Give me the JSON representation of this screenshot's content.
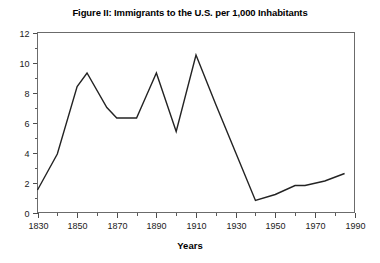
{
  "chart_data": {
    "type": "line",
    "title": "Figure II: Immigrants to the U.S. per 1,000 Inhabitants",
    "xlabel": "Years",
    "ylabel": "",
    "xlim": [
      1830,
      1990
    ],
    "ylim": [
      0,
      12
    ],
    "grid": false,
    "legend": "none",
    "x_major_ticks": [
      1830,
      1850,
      1870,
      1890,
      1910,
      1930,
      1950,
      1970,
      1990
    ],
    "x_minor_ticks": [
      1840,
      1860,
      1880,
      1900,
      1920,
      1940,
      1960,
      1980
    ],
    "x_tick_labels": [
      "1830",
      "1850",
      "1870",
      "1890",
      "1910",
      "1930",
      "1950",
      "1970",
      "1990"
    ],
    "y_major_ticks": [
      0,
      2,
      4,
      6,
      8,
      10,
      12
    ],
    "y_minor_ticks": [
      1,
      3,
      5,
      7,
      9,
      11
    ],
    "y_tick_labels": [
      "0",
      "2",
      "4",
      "6",
      "8",
      "10",
      "12"
    ],
    "series": [
      {
        "name": "Immigrants per 1,000 inhabitants",
        "color": "#232323",
        "x": [
          1830,
          1840,
          1850,
          1855,
          1865,
          1870,
          1880,
          1885,
          1890,
          1900,
          1910,
          1920,
          1930,
          1940,
          1950,
          1960,
          1965,
          1975,
          1985
        ],
        "values": [
          1.5,
          3.9,
          8.4,
          9.3,
          7.0,
          6.3,
          6.3,
          7.8,
          9.3,
          5.4,
          10.5,
          7.2,
          4.0,
          0.8,
          1.2,
          1.8,
          1.8,
          2.1,
          2.6
        ]
      }
    ]
  },
  "axes": {
    "x_axis_name": "years-axis",
    "y_axis_name": "rate-axis"
  }
}
